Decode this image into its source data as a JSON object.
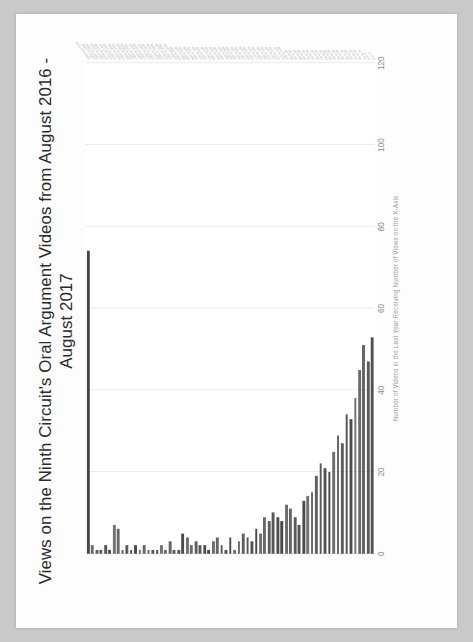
{
  "document": {
    "background_color": "#c9c9c9",
    "sheet_color": "#fdfdfd"
  },
  "chart_data": {
    "type": "bar",
    "orientation": "horizontal",
    "title": "Views on the Ninth Circuit's Oral Argument Videos from August 2016 - August 2017",
    "title_line1": "Views on the Ninth Circuit's Oral Argument Videos from August 2016 -",
    "title_line2": "August 2017",
    "xlabel": "Number of Videos in the Last Year Receiving Number of Views on the X-Axis",
    "ylabel": "",
    "xlim": [
      0,
      120
    ],
    "xticks": [
      0,
      20,
      40,
      60,
      80,
      100,
      120
    ],
    "xticklabels": [
      "0",
      "20",
      "40",
      "60",
      "80",
      "100",
      "120"
    ],
    "grid": true,
    "grid_color": "#e9e9e9",
    "legend": "none",
    "bar_color": "#6b6b6b",
    "categories": [
      "2000 and Over",
      "1950 to 1999",
      "1900 to 1949",
      "1850 to 1899",
      "1800 to 1849",
      "1750 to 1799",
      "1700 to 1749",
      "1650 to 1699",
      "1600 to 1649",
      "1550 to 1599",
      "1500 to 1549",
      "1450 to 1499",
      "1400 to 1449",
      "1350 to 1399",
      "1300 to 1349",
      "1250 to 1299",
      "1200 to 1249",
      "1150 to 1199",
      "1100 to 1149",
      "1050 to 1099",
      "1000 to 1049",
      "950 to 999",
      "900 to 949",
      "850 to 899",
      "800 to 849",
      "750 to 799",
      "700 to 749",
      "650 to 699",
      "600 to 649",
      "550 to 599",
      "500 to 549",
      "450 to 499",
      "400 to 449",
      "350 to 399",
      "300 to 349",
      "250 to 299",
      "200 to 249",
      "190 to 199",
      "180 to 189",
      "170 to 179",
      "160 to 169",
      "150 to 159",
      "140 to 149",
      "130 to 139",
      "120 to 129",
      "110 to 119",
      "100 to 109",
      "95 to 99",
      "90 to 94",
      "85 to 89",
      "80 to 84",
      "75 to 79",
      "70 to 74",
      "65 to 69",
      "60 to 64",
      "55 to 59",
      "50 to 54",
      "45 to 49",
      "40 to 44",
      "35 to 39",
      "30 to 34",
      "25 to 29",
      "20 to 24",
      "15 to 19",
      "10 to 14",
      "5 to 9",
      "0 to 4"
    ],
    "values": [
      74,
      2,
      1,
      1,
      2,
      1,
      7,
      6,
      1,
      2,
      1,
      2,
      1,
      2,
      1,
      1,
      1,
      2,
      1,
      3,
      1,
      1,
      5,
      4,
      2,
      3,
      2,
      2,
      1,
      3,
      4,
      2,
      1,
      4,
      1,
      3,
      5,
      4,
      3,
      6,
      5,
      9,
      8,
      10,
      9,
      8,
      12,
      11,
      9,
      7,
      13,
      14,
      15,
      19,
      22,
      21,
      20,
      25,
      29,
      27,
      34,
      33,
      38,
      45,
      51,
      47,
      53
    ]
  }
}
